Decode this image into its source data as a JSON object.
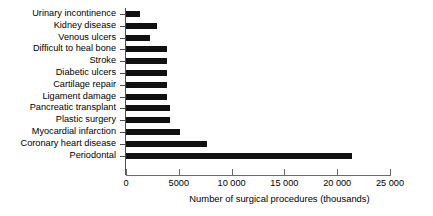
{
  "chart_data": {
    "type": "bar",
    "orientation": "horizontal",
    "title": "",
    "xlabel": "Number of surgical procedures (thousands)",
    "ylabel": "",
    "xlim": [
      0,
      25000
    ],
    "grid": false,
    "legend": null,
    "xticks": [
      0,
      5000,
      10000,
      15000,
      20000,
      25000
    ],
    "xtick_labels": [
      "0",
      "5000",
      "10 000",
      "15 000",
      "20 000",
      "25 000"
    ],
    "bar_color": "#111111",
    "axis_color": "#4d4d4d",
    "categories": [
      "Urinary incontinence",
      "Kidney disease",
      "Venous ulcers",
      "Difficult to heal bone",
      "Stroke",
      "Diabetic ulcers",
      "Cartilage repair",
      "Ligament damage",
      "Pancreatic transplant",
      "Plastic surgery",
      "Myocardial infarction",
      "Coronary heart disease",
      "Periodontal"
    ],
    "values": [
      1300,
      2900,
      2300,
      3900,
      3900,
      3900,
      3900,
      3900,
      4200,
      4200,
      5100,
      7700,
      21400
    ]
  }
}
